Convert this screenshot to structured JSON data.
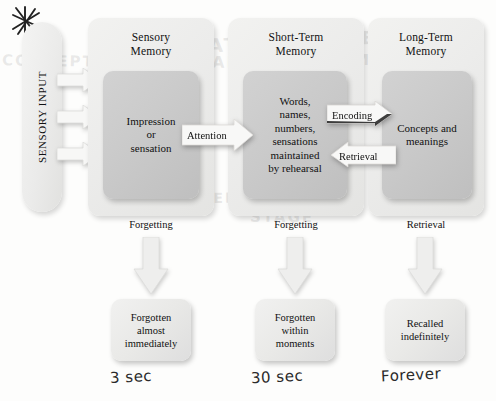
{
  "diagram": {
    "star_mark_icon": "asterisk-star-icon"
  },
  "sensory_input": {
    "label": "SENSORY INPUT",
    "arrows": [
      "sensory-arrow-1",
      "sensory-arrow-2",
      "sensory-arrow-3"
    ]
  },
  "stages": [
    {
      "id": "sensory-memory",
      "title": "Sensory\nMemory",
      "title_line1": "Sensory",
      "title_line2": "Memory",
      "inner_lines": [
        "Impression",
        "or",
        "sensation"
      ],
      "exit_label": "Forgetting",
      "outcome_lines": [
        "Forgotten",
        "almost",
        "immediately"
      ],
      "duration_note": "3 sec"
    },
    {
      "id": "short-term-memory",
      "title_line1": "Short-Term",
      "title_line2": "Memory",
      "inner_lines": [
        "Words,",
        "names,",
        "numbers,",
        "sensations",
        "maintained",
        "by rehearsal"
      ],
      "exit_label": "Forgetting",
      "outcome_lines": [
        "Forgotten",
        "within",
        "moments"
      ],
      "duration_note": "30 sec"
    },
    {
      "id": "long-term-memory",
      "title_line1": "Long-Term",
      "title_line2": "Memory",
      "inner_lines": [
        "Concepts and",
        "meanings"
      ],
      "exit_label": "Retrieval",
      "outcome_lines": [
        "Recalled",
        "indefinitely"
      ],
      "duration_note": "Forever"
    }
  ],
  "transitions": {
    "attention": "Attention",
    "encoding": "Encoding",
    "retrieval": "Retrieval"
  },
  "colors": {
    "page_background": "#fdfdfc",
    "panel_fill": "#ececeb",
    "inner_fill": "#c9c9c9",
    "outcome_fill": "#e9e9e7",
    "text": "#111111",
    "handwriting": "#2a2a2a"
  },
  "ghost_text": {
    "g1": "EXPLANATION OF",
    "g2": "AND COMPARE",
    "g3": "TION OF MEM",
    "g4": "NOTE SYSTEM",
    "g5": "CONCEPT",
    "g6": "MODEL",
    "g7": "STAGE"
  }
}
